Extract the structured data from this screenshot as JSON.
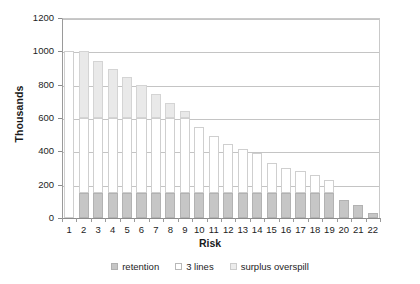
{
  "chart_data": {
    "type": "bar",
    "stacked": true,
    "title": "",
    "xlabel": "Risk",
    "ylabel": "Thousands",
    "ylim": [
      0,
      1200
    ],
    "ytick_step": 200,
    "yticks": [
      0,
      200,
      400,
      600,
      800,
      1000,
      1200
    ],
    "grid": true,
    "legend_position": "bottom",
    "categories": [
      "1",
      "2",
      "3",
      "4",
      "5",
      "6",
      "7",
      "8",
      "9",
      "10",
      "11",
      "12",
      "13",
      "14",
      "15",
      "16",
      "17",
      "18",
      "19",
      "20",
      "21",
      "22"
    ],
    "series": [
      {
        "name": "retention",
        "color": "#c6c6c6",
        "values": [
          0,
          150,
          150,
          150,
          150,
          150,
          150,
          150,
          150,
          150,
          150,
          150,
          150,
          150,
          150,
          150,
          150,
          150,
          150,
          110,
          80,
          30
        ]
      },
      {
        "name": "3 lines",
        "color": "#ffffff",
        "values": [
          1000,
          450,
          450,
          450,
          450,
          450,
          450,
          450,
          450,
          395,
          340,
          295,
          265,
          240,
          180,
          150,
          135,
          110,
          80,
          0,
          0,
          0
        ]
      },
      {
        "name": "surplus overspill",
        "color": "#e9e9e9",
        "values": [
          0,
          400,
          345,
          295,
          245,
          200,
          145,
          90,
          40,
          0,
          0,
          0,
          0,
          0,
          0,
          0,
          0,
          0,
          0,
          0,
          0,
          0
        ]
      }
    ],
    "totals": [
      1000,
      1000,
      945,
      895,
      845,
      800,
      745,
      690,
      640,
      545,
      490,
      445,
      415,
      390,
      330,
      300,
      285,
      260,
      230,
      110,
      80,
      30
    ]
  },
  "axis": {
    "y_title": "Thousands",
    "x_title": "Risk"
  },
  "legend": {
    "items": [
      {
        "label": "retention",
        "swatch": "retention-swatch"
      },
      {
        "label": "3 lines",
        "swatch": "lines-swatch"
      },
      {
        "label": "surplus overspill",
        "swatch": "surplus-swatch"
      }
    ]
  }
}
